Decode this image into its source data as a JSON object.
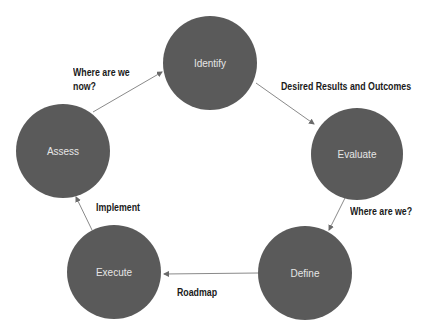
{
  "diagram": {
    "type": "cycle",
    "node_color": "#5a5a5a",
    "edge_color": "#8a8a8a",
    "nodes": [
      {
        "id": "identify",
        "label": "Identify",
        "cx": 210,
        "cy": 63,
        "r": 47
      },
      {
        "id": "evaluate",
        "label": "Evaluate",
        "cx": 357,
        "cy": 154,
        "r": 46
      },
      {
        "id": "define",
        "label": "Define",
        "cx": 305,
        "cy": 273,
        "r": 47
      },
      {
        "id": "execute",
        "label": "Execute",
        "cx": 114,
        "cy": 272,
        "r": 47
      },
      {
        "id": "assess",
        "label": "Assess",
        "cx": 63,
        "cy": 151,
        "r": 47
      }
    ],
    "edges": [
      {
        "from": "assess",
        "to": "identify",
        "label_line1": "Where are we",
        "label_line2": "now?"
      },
      {
        "from": "identify",
        "to": "evaluate",
        "label": "Desired Results and Outcomes"
      },
      {
        "from": "evaluate",
        "to": "define",
        "label": "Where are we?"
      },
      {
        "from": "define",
        "to": "execute",
        "label": "Roadmap"
      },
      {
        "from": "execute",
        "to": "assess",
        "label": "Implement"
      }
    ]
  }
}
